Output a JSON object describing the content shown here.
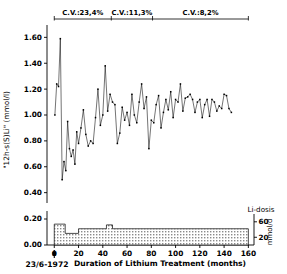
{
  "figure": {
    "xlabel": "Duration of Lithium Treatment (months)",
    "ylabel": "\"12h-s(S)Li\" (mmol/l)",
    "start_date": "23/6-1972",
    "dose_legend": "Li-dosis",
    "dose_unit": "mmol/d"
  },
  "cv_bands": [
    {
      "label": "C.V.:23,4%",
      "x_start": 0,
      "x_end": 47
    },
    {
      "label": "C.V.:11,3%",
      "x_start": 47,
      "x_end": 81
    },
    {
      "label": "C.V.:8,2%",
      "x_start": 81,
      "x_end": 160
    }
  ],
  "chart_data": {
    "type": "line",
    "title": "",
    "xlabel": "Duration of Lithium Treatment (months)",
    "ylabel": "\"12h-s(S)Li\" (mmol/l)",
    "xlim": [
      -6,
      163
    ],
    "ylim": [
      0.32,
      1.68
    ],
    "xticks": [
      0,
      20,
      40,
      60,
      80,
      100,
      120,
      140,
      160
    ],
    "xticklabels": [
      "0",
      "20",
      "40",
      "60",
      "80",
      "100",
      "120",
      "140",
      "160"
    ],
    "yticks": [
      0.4,
      0.6,
      0.8,
      1.0,
      1.2,
      1.4,
      1.6
    ],
    "yticklabels": [
      "0.40",
      "0.60",
      "0.80",
      "1.00",
      "1.20",
      "1.40",
      "1.60"
    ],
    "grid": false,
    "legend": "none",
    "marker": "dot",
    "series": [
      {
        "name": "12h-s(S)Li",
        "x": [
          0.5,
          2.0,
          3.5,
          5.0,
          6.5,
          8.0,
          9.5,
          11.0,
          12.5,
          14.0,
          15.5,
          17.0,
          18.5,
          20.0,
          22.0,
          24.0,
          26.0,
          28.0,
          30.0,
          32.0,
          34.0,
          36.0,
          38.0,
          40.0,
          42.0,
          44.0,
          46.0,
          48.0,
          50.0,
          52.0,
          54.0,
          56.0,
          58.0,
          60.0,
          62.0,
          64.0,
          66.0,
          68.0,
          70.0,
          72.0,
          74.0,
          76.0,
          78.0,
          80.0,
          82.0,
          84.0,
          86.0,
          88.0,
          90.0,
          92.0,
          94.0,
          96.0,
          98.0,
          100.0,
          102.0,
          104.0,
          106.0,
          108.0,
          110.0,
          112.0,
          114.0,
          116.0,
          118.0,
          120.0,
          122.0,
          124.0,
          126.0,
          128.0,
          130.0,
          132.0,
          134.0,
          136.0,
          138.0,
          140.0,
          142.0,
          144.0,
          146.0
        ],
        "y": [
          1.0,
          1.24,
          1.22,
          1.59,
          0.5,
          0.64,
          0.57,
          0.95,
          0.74,
          0.68,
          0.73,
          0.62,
          0.87,
          0.78,
          0.9,
          1.04,
          0.85,
          0.76,
          0.8,
          0.78,
          0.98,
          1.2,
          0.92,
          1.0,
          1.38,
          1.03,
          1.16,
          1.1,
          1.08,
          0.78,
          0.86,
          1.06,
          0.96,
          1.02,
          0.92,
          1.16,
          1.0,
          0.94,
          1.1,
          1.24,
          1.05,
          1.14,
          0.74,
          0.96,
          0.94,
          1.08,
          1.15,
          0.9,
          1.02,
          1.12,
          1.04,
          1.18,
          0.98,
          1.12,
          1.1,
          1.24,
          1.03,
          1.13,
          1.14,
          1.16,
          1.12,
          1.02,
          1.1,
          1.12,
          0.98,
          1.08,
          1.12,
          0.99,
          1.12,
          1.1,
          1.03,
          1.07,
          1.05,
          1.16,
          1.15,
          1.05,
          1.02
        ]
      }
    ]
  },
  "dose_chart": {
    "type": "area",
    "ylabel": "mmol/d",
    "yticks": [
      20,
      60
    ],
    "yticklabels": [
      "20",
      "60"
    ],
    "ylim": [
      0,
      75
    ],
    "steps": [
      {
        "x_start": 0,
        "x_end": 9,
        "value": 54
      },
      {
        "x_start": 9,
        "x_end": 20,
        "value": 30
      },
      {
        "x_start": 20,
        "x_end": 43,
        "value": 42
      },
      {
        "x_start": 43,
        "x_end": 48,
        "value": 52
      },
      {
        "x_start": 48,
        "x_end": 160,
        "value": 42
      }
    ]
  }
}
